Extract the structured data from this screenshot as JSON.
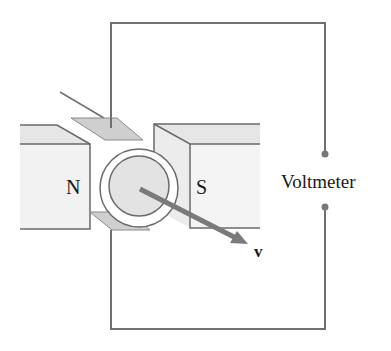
{
  "diagram": {
    "type": "homopolar generator (Faraday disk) circuit",
    "labels": {
      "north_pole": "N",
      "south_pole": "S",
      "meter": "Voltmeter",
      "velocity": "v"
    },
    "colors": {
      "wire": "#707070",
      "magnet_face": "#f2f2f2",
      "magnet_top": "#e6e6e6",
      "magnet_outline": "#6a6a6a",
      "contact_plate": "#cfcfcf",
      "disk_fill": "#e3e3e3",
      "ring_fill": "#ffffff",
      "velocity_arrow": "#7a7a7a",
      "terminal_dot": "#777777",
      "text": "#1a1a1a"
    }
  }
}
